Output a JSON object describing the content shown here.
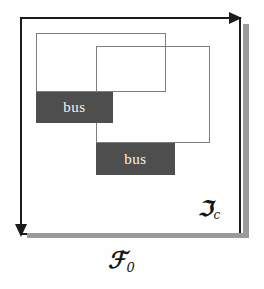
{
  "figure": {
    "caption_labels": {
      "frame": {
        "symbol": "ℱ",
        "subscript": "0",
        "name": "F-zero"
      },
      "canvas": {
        "symbol": "ℑ",
        "subscript": "c",
        "name": "I-sub-c"
      }
    },
    "colors": {
      "background": "#ffffff",
      "frame_stroke": "#1b1b1b",
      "frame_shadow": "#9a9a9a",
      "detection_box_stroke": "#7d7d7d",
      "label_fill": "#4e4e4e",
      "label_text": "#f4f4f4"
    },
    "canvas_frame": {
      "x": 20,
      "y": 17,
      "width": 221,
      "height": 218,
      "axes": [
        {
          "name": "horizontal-axis",
          "direction": "right"
        },
        {
          "name": "vertical-axis",
          "direction": "down"
        }
      ]
    },
    "detection_boxes": [
      {
        "id": 1,
        "x": 36,
        "y": 33,
        "width": 130,
        "height": 59
      },
      {
        "id": 2,
        "x": 96,
        "y": 46,
        "width": 114,
        "height": 97
      }
    ],
    "class_labels": [
      {
        "id": 1,
        "text": "bus",
        "x": 36,
        "y": 92,
        "width": 77,
        "height": 31
      },
      {
        "id": 2,
        "text": "bus",
        "x": 96,
        "y": 143,
        "width": 79,
        "height": 32
      }
    ]
  }
}
